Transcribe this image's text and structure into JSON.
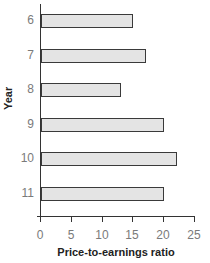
{
  "chart_data": {
    "type": "bar",
    "orientation": "horizontal",
    "title": "",
    "xlabel": "Price-to-earnings ratio",
    "ylabel": "Year",
    "categories": [
      "6",
      "7",
      "8",
      "9",
      "10",
      "11"
    ],
    "values": [
      15,
      17,
      13,
      20,
      22,
      20
    ],
    "xlim": [
      0,
      25
    ],
    "xticks": [
      "0",
      "5",
      "10",
      "15",
      "20",
      "25"
    ],
    "grid": false,
    "legend": null,
    "bar_fill": "#e4e4e4",
    "bar_border": "#3a3a3a"
  }
}
